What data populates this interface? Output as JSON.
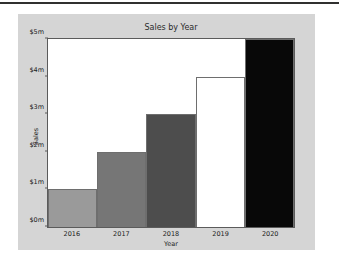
{
  "page": {
    "background_color": "#ffffff",
    "rule_color": "#30302f",
    "figure_background": "#d5d5d5"
  },
  "chart_data": {
    "type": "bar",
    "title": "Sales by Year",
    "xlabel": "Year",
    "ylabel": "Sales",
    "categories": [
      "2016",
      "2017",
      "2018",
      "2019",
      "2020"
    ],
    "values": [
      1,
      2,
      3,
      4,
      5
    ],
    "value_unit": "$m",
    "ylim": [
      0,
      5
    ],
    "ytick_values": [
      0,
      1,
      2,
      3,
      4,
      5
    ],
    "ytick_labels": [
      "$0m",
      "$1m",
      "$2m",
      "$3m",
      "$4m",
      "$5m"
    ],
    "grid": false,
    "legend": null,
    "bar_colors": [
      "#9a9a9a",
      "#767676",
      "#4d4d4d",
      "#ffffff",
      "#080808"
    ],
    "bar_edge_color": "#6e6e6e",
    "axes_background": "#ffffff",
    "axes_border_color": "#5b5b5b"
  }
}
